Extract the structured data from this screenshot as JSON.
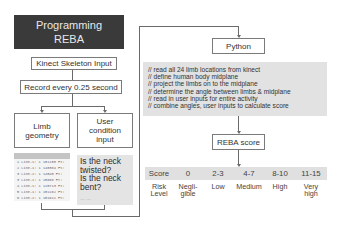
{
  "title_box": {
    "line1": "Programming",
    "line2": "REBA",
    "bg_color": "#3a3a3a"
  },
  "steps": {
    "kinect": "Kinect Skeleton Input",
    "record": "Record every 0.25 second",
    "limb": "Limb geometry",
    "user": "User condition input",
    "python": "Python",
    "reba": "REBA score"
  },
  "limb_data_lines": [
    "1 Line-1: 1 151150 Ft:",
    "2 Line-1: 1 140384 Ft:",
    "3 Line-1: 1 14540 Ft:",
    "3 Line-1: 1 15868 Ft:",
    "4 Line-1: 1 115713 Ft:",
    "5 Line-1: 1 151162 Ft:",
    "6 Line-1: 1 151611 Ft:"
  ],
  "user_questions": {
    "q1": "Is the neck twisted?",
    "q2": "Is the neck bent?",
    "ellipsis": "……"
  },
  "python_comments": [
    "// read all 24 limb locations from kinect",
    "// define human body midplane",
    "// project the limbs on to the midplane",
    "// determine the angle between limbs & midplane",
    "// read in user inputs for entire activity",
    "// combine angles, user inputs to calculate score"
  ],
  "score_table": {
    "score_label": "Score",
    "risk_label": "Risk\nLevel",
    "columns": [
      {
        "score": "0",
        "risk": "Negli-\ngible"
      },
      {
        "score": "2-3",
        "risk": "Low"
      },
      {
        "score": "4-7",
        "risk": "Medium"
      },
      {
        "score": "8-10",
        "risk": "High"
      },
      {
        "score": "11-15",
        "risk": "Very\nhigh"
      }
    ]
  }
}
